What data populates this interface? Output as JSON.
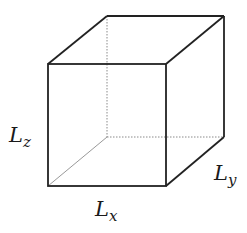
{
  "diagram": {
    "type": "cube-wireframe",
    "labels": {
      "x": {
        "main": "L",
        "sub": "x"
      },
      "y": {
        "main": "L",
        "sub": "y"
      },
      "z": {
        "main": "L",
        "sub": "z"
      }
    },
    "colors": {
      "edge": "#222222",
      "hidden_edge": "#888888",
      "background": "#ffffff"
    }
  }
}
